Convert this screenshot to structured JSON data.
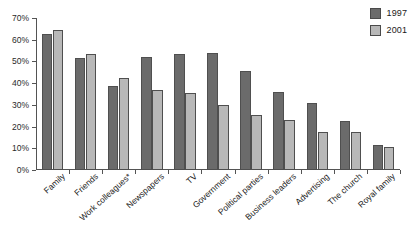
{
  "chart_data": {
    "type": "bar",
    "title": "",
    "subtitle": "",
    "xlabel": "",
    "ylabel": "",
    "ylim": [
      0,
      70
    ],
    "grid": false,
    "legend_position": "top-right",
    "y_ticks": [
      "0%",
      "10%",
      "20%",
      "30%",
      "40%",
      "50%",
      "60%",
      "70%"
    ],
    "y_tick_values": [
      0,
      10,
      20,
      30,
      40,
      50,
      60,
      70
    ],
    "categories": [
      "Family",
      "Friends",
      "Work colleagues*",
      "Newspapers",
      "TV",
      "Government",
      "Political parties",
      "Business leaders",
      "Advertising",
      "The church",
      "Royal family"
    ],
    "series": [
      {
        "name": "1997",
        "color": "#6b6b6b",
        "values": [
          62.5,
          51.5,
          38.5,
          52,
          53.5,
          54,
          45.5,
          36,
          31,
          22.5,
          11.5
        ]
      },
      {
        "name": "2001",
        "color": "#b8b8b8",
        "values": [
          64.5,
          53.5,
          42.5,
          37,
          35.5,
          30,
          25.5,
          23,
          17.5,
          17.5,
          10.5
        ]
      }
    ]
  },
  "legend": {
    "entries": [
      {
        "label": "1997",
        "color": "#6b6b6b"
      },
      {
        "label": "2001",
        "color": "#b8b8b8"
      }
    ]
  }
}
